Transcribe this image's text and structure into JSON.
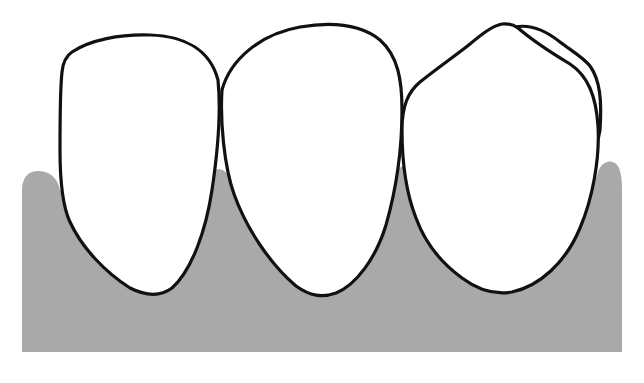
{
  "diagram": {
    "type": "dental-illustration",
    "colors": {
      "background": "#ffffff",
      "gum": "#a9a9a9",
      "tooth_fill": "#ffffff",
      "outline": "#111111"
    },
    "elements": [
      {
        "id": "gum",
        "label": ""
      },
      {
        "id": "tooth-1",
        "label": ""
      },
      {
        "id": "tooth-2",
        "label": ""
      },
      {
        "id": "tooth-3",
        "label": "",
        "note": "double contour on upper-right edge"
      }
    ]
  }
}
